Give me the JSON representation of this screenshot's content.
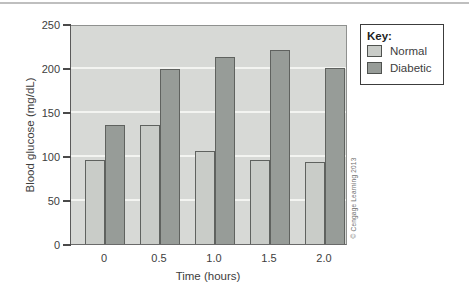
{
  "chart_data": {
    "type": "bar",
    "title": "",
    "categories": [
      "0",
      "0.5",
      "1.0",
      "1.5",
      "2.0"
    ],
    "series": [
      {
        "name": "Normal",
        "color": "#c9ccc8",
        "values": [
          95,
          135,
          106,
          96,
          93
        ]
      },
      {
        "name": "Diabetic",
        "color": "#979c98",
        "values": [
          135,
          199,
          212,
          220,
          200
        ]
      }
    ],
    "xlabel": "Time (hours)",
    "ylabel": "Blood glucose (mg/dL)",
    "ylim": [
      0,
      250
    ],
    "ytick_step": 50,
    "ytick_labels": [
      "0",
      "50",
      "100",
      "150",
      "200",
      "250"
    ],
    "grid": true,
    "gridline_color": "#f3f4f1",
    "plot_background": "#d7d9d6",
    "legend_position": "right"
  },
  "legend": {
    "title": "Key:",
    "items": [
      {
        "label": "Normal",
        "color": "#c9ccc8"
      },
      {
        "label": "Diabetic",
        "color": "#979c98"
      }
    ]
  },
  "credit": "© Cengage Learning 2013"
}
